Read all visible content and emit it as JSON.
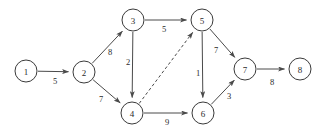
{
  "chart_data": {
    "type": "diagram",
    "diagram_kind": "directed-weighted-graph",
    "title": "",
    "width": 323,
    "height": 133,
    "node_radius": 11,
    "colors": {
      "background": "#ffffff",
      "node_fill": "#ffffff",
      "node_stroke": "#3a3a3a",
      "edge_stroke": "#4a4a4a",
      "text": "#2b2b2b"
    },
    "nodes": [
      {
        "id": "1",
        "label": "1",
        "x": 26,
        "y": 71
      },
      {
        "id": "2",
        "label": "2",
        "x": 84,
        "y": 72
      },
      {
        "id": "3",
        "label": "3",
        "x": 133,
        "y": 20
      },
      {
        "id": "4",
        "label": "4",
        "x": 132,
        "y": 113
      },
      {
        "id": "5",
        "label": "5",
        "x": 202,
        "y": 20
      },
      {
        "id": "6",
        "label": "6",
        "x": 203,
        "y": 113
      },
      {
        "id": "7",
        "label": "7",
        "x": 245,
        "y": 69
      },
      {
        "id": "8",
        "label": "8",
        "x": 300,
        "y": 69
      }
    ],
    "edges": [
      {
        "from": "1",
        "to": "2",
        "weight": "5",
        "style": "solid",
        "directed": true,
        "label_x": 55,
        "label_y": 81
      },
      {
        "from": "2",
        "to": "3",
        "weight": "8",
        "style": "solid",
        "directed": true,
        "label_x": 110,
        "label_y": 52
      },
      {
        "from": "2",
        "to": "4",
        "weight": "7",
        "style": "solid",
        "directed": true,
        "label_x": 101,
        "label_y": 99
      },
      {
        "from": "3",
        "to": "5",
        "weight": "5",
        "style": "solid",
        "directed": true,
        "label_x": 164,
        "label_y": 29
      },
      {
        "from": "3",
        "to": "4",
        "weight": "2",
        "style": "solid",
        "directed": true,
        "label_x": 128,
        "label_y": 62
      },
      {
        "from": "4",
        "to": "5",
        "weight": "",
        "style": "dashed",
        "directed": true,
        "label_x": 0,
        "label_y": 0
      },
      {
        "from": "4",
        "to": "6",
        "weight": "9",
        "style": "solid",
        "directed": true,
        "label_x": 167,
        "label_y": 122
      },
      {
        "from": "5",
        "to": "6",
        "weight": "1",
        "style": "solid",
        "directed": true,
        "label_x": 198,
        "label_y": 73
      },
      {
        "from": "5",
        "to": "7",
        "weight": "7",
        "style": "solid",
        "directed": true,
        "label_x": 216,
        "label_y": 50
      },
      {
        "from": "6",
        "to": "7",
        "weight": "3",
        "style": "solid",
        "directed": true,
        "label_x": 229,
        "label_y": 96
      },
      {
        "from": "7",
        "to": "8",
        "weight": "8",
        "style": "solid",
        "directed": true,
        "label_x": 272,
        "label_y": 82
      }
    ]
  }
}
